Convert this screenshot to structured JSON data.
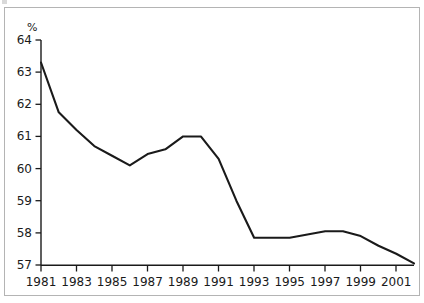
{
  "figure": {
    "unit_label": "%",
    "frame_color": "#b4b4b4",
    "line_color": "#1a1a1a",
    "axis_color": "#1a1a1a",
    "background": "#ffffff"
  },
  "chart_data": {
    "type": "line",
    "title": "",
    "subtitle": "",
    "xlabel": "",
    "ylabel": "%",
    "grid": false,
    "legend": "none",
    "xlim": [
      1981,
      2002
    ],
    "ylim": [
      57,
      64
    ],
    "ytick_labels": [
      "64",
      "63",
      "62",
      "61",
      "60",
      "59",
      "58",
      "57"
    ],
    "ytick_values": [
      64,
      63,
      62,
      61,
      60,
      59,
      58,
      57
    ],
    "xtick_labels": [
      "1981",
      "1983",
      "1985",
      "1987",
      "1989",
      "1991",
      "1993",
      "1995",
      "1997",
      "1999",
      "2001"
    ],
    "xtick_values": [
      1981,
      1983,
      1985,
      1987,
      1989,
      1991,
      1993,
      1995,
      1997,
      1999,
      2001
    ],
    "x": [
      1981,
      1982,
      1983,
      1984,
      1985,
      1986,
      1987,
      1988,
      1989,
      1990,
      1991,
      1992,
      1993,
      1994,
      1995,
      1996,
      1997,
      1998,
      1999,
      2000,
      2001,
      2002
    ],
    "values": [
      63.3,
      61.75,
      61.2,
      60.7,
      60.4,
      60.1,
      60.45,
      60.6,
      61.0,
      61.0,
      60.3,
      59.0,
      57.85,
      57.85,
      57.85,
      57.95,
      58.05,
      58.05,
      57.9,
      57.6,
      57.35,
      57.05
    ],
    "series": [
      {
        "name": "",
        "values": [
          63.3,
          61.75,
          61.2,
          60.7,
          60.4,
          60.1,
          60.45,
          60.6,
          61.0,
          61.0,
          60.3,
          59.0,
          57.85,
          57.85,
          57.85,
          57.95,
          58.05,
          58.05,
          57.9,
          57.6,
          57.35,
          57.05
        ]
      }
    ]
  }
}
